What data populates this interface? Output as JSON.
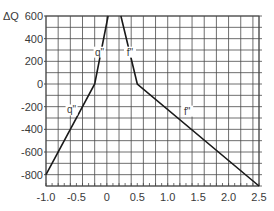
{
  "chart_data": {
    "type": "line",
    "title": "",
    "xlabel": "",
    "ylabel": "ΔQ",
    "xlim": [
      -1.0,
      2.5
    ],
    "ylim": [
      -900,
      600
    ],
    "grid": true,
    "grid_x_step": 0.1,
    "grid_y_step": 100,
    "legend": "inline labels",
    "x_ticks": [
      -1.0,
      -0.5,
      0,
      0.5,
      1.0,
      1.5,
      2.0,
      2.5
    ],
    "x_tick_labels": [
      "-1.0",
      "-0.5",
      "0",
      "0.5",
      "1.0",
      "1.5",
      "2.0",
      "2.5"
    ],
    "y_ticks": [
      600,
      400,
      200,
      0,
      -200,
      -400,
      -600,
      -800
    ],
    "y_tick_labels": [
      "600",
      "400",
      "200",
      "0",
      "-200",
      "-400",
      "-600",
      "-800"
    ],
    "series": [
      {
        "name": "q\"",
        "points": [
          [
            -1.0,
            -800
          ],
          [
            -0.2,
            0
          ],
          [
            0.02,
            600
          ]
        ],
        "labels": [
          {
            "text": "q\"",
            "x": -0.12,
            "y": 250
          },
          {
            "text": "q\"",
            "x": -0.58,
            "y": -260
          }
        ]
      },
      {
        "name": "f\"",
        "points": [
          [
            0.23,
            600
          ],
          [
            0.5,
            0
          ],
          [
            2.5,
            -900
          ]
        ],
        "labels": [
          {
            "text": "f\"",
            "x": 0.38,
            "y": 250
          },
          {
            "text": "f\"",
            "x": 1.32,
            "y": -270
          }
        ]
      }
    ]
  },
  "axis": {
    "y_title": "ΔQ"
  },
  "colors": {
    "grid": "#4a4a4a",
    "line": "#1a1a1a",
    "text": "#3a3a3a"
  }
}
